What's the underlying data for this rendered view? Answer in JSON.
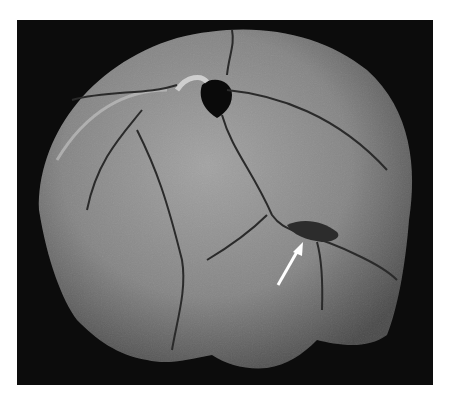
{
  "image": {
    "subject": "skull",
    "view": "posterior cranial vault",
    "background_color": "#0c0c0c",
    "bone_color": "#8a8a8a",
    "features": [
      {
        "name": "perforation",
        "description": "dark hole near top center"
      },
      {
        "name": "fracture-lines",
        "description": "radiating cracks across vault"
      },
      {
        "name": "lesion",
        "description": "depressed region marked by arrow"
      }
    ],
    "annotation": {
      "type": "arrow",
      "color": "#ffffff",
      "points_to": "lesion"
    }
  }
}
